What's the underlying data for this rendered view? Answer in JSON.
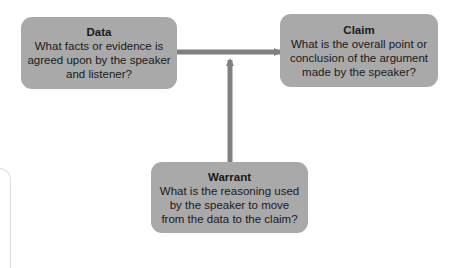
{
  "diagram": {
    "type": "toulmin-argument-model",
    "nodes": {
      "data": {
        "title": "Data",
        "text": "What facts or evidence is agreed upon by the speaker and listener?"
      },
      "claim": {
        "title": "Claim",
        "text": "What is the overall point or conclusion of the argument made by the speaker?"
      },
      "warrant": {
        "title": "Warrant",
        "text": "What is the reasoning used by the speaker to move from the data to the claim?"
      }
    },
    "edges": [
      {
        "from": "data",
        "to": "claim",
        "style": "arrow"
      },
      {
        "from": "warrant",
        "to": "data-claim-edge",
        "style": "arrow"
      }
    ],
    "colors": {
      "box_fill": "#a9a9a9",
      "arrow": "#808080",
      "text": "#1a1a1a",
      "background": "#ffffff"
    }
  }
}
